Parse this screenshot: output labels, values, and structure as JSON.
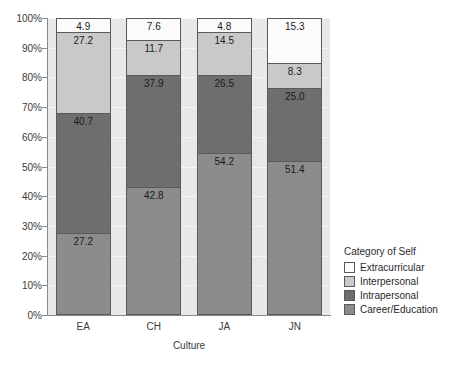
{
  "chart_data": {
    "type": "bar",
    "title": "",
    "subtitle": "",
    "xlabel": "Culture",
    "ylabel": "",
    "ylim": [
      0,
      100
    ],
    "stacked": true,
    "stack_mode": "percent",
    "grid": true,
    "legend_position": "right",
    "legend_title": "Category of Self",
    "categories": [
      "EA",
      "CH",
      "JA",
      "JN"
    ],
    "ytick_labels": [
      "0%",
      "10%",
      "20%",
      "30%",
      "40%",
      "50%",
      "60%",
      "70%",
      "80%",
      "90%",
      "100%"
    ],
    "ytick_values": [
      0,
      10,
      20,
      30,
      40,
      50,
      60,
      70,
      80,
      90,
      100
    ],
    "series": [
      {
        "name": "Extracurricular",
        "color": "#fbfbfb",
        "values": [
          4.9,
          7.6,
          4.8,
          15.3
        ]
      },
      {
        "name": "Interpersonal",
        "color": "#c9c9c9",
        "values": [
          27.2,
          11.7,
          14.5,
          8.3
        ]
      },
      {
        "name": "Intrapersonal",
        "color": "#6e6e6e",
        "values": [
          40.7,
          37.9,
          26.5,
          25.0
        ]
      },
      {
        "name": "Career/Education",
        "color": "#8c8c8c",
        "values": [
          27.2,
          42.8,
          54.2,
          51.4
        ]
      }
    ],
    "colors": {
      "plot_background": "#e8e8e8",
      "gridline": "#f6f6f6",
      "axis": "#8a8a8a",
      "bar_outline": "#5a5a5a",
      "text": "#2a2a2a"
    }
  }
}
